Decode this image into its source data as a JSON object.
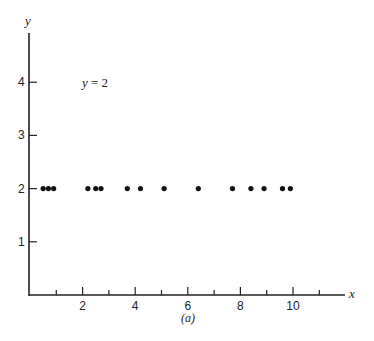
{
  "chart_data": {
    "type": "scatter",
    "title": "",
    "caption": "(a)",
    "xlabel": "x",
    "ylabel": "y",
    "xlim": [
      0,
      11.5
    ],
    "ylim": [
      0,
      4.9
    ],
    "grid": false,
    "legend": null,
    "annotation": {
      "text": "y = 2",
      "x": 2,
      "y": 4
    },
    "x_ticks_major": [
      2,
      4,
      6,
      8,
      10
    ],
    "x_ticks_minor": [
      1,
      3,
      5,
      7,
      9,
      11
    ],
    "x_tick_labels": [
      "2",
      "4",
      "6",
      "8",
      "10"
    ],
    "y_ticks": [
      1,
      2,
      3,
      4
    ],
    "y_tick_labels": [
      "1",
      "2",
      "3",
      "4"
    ],
    "series": [
      {
        "name": "y = 2",
        "x": [
          0.5,
          0.7,
          0.9,
          2.2,
          2.5,
          2.7,
          3.7,
          4.2,
          5.1,
          6.4,
          7.7,
          8.4,
          8.9,
          9.6,
          9.9
        ],
        "y": [
          2,
          2,
          2,
          2,
          2,
          2,
          2,
          2,
          2,
          2,
          2,
          2,
          2,
          2,
          2
        ]
      }
    ]
  },
  "labels": {
    "x_axis": "x",
    "y_axis": "y",
    "annotation_lhs": "y",
    "annotation_rhs": " = 2",
    "caption": "(a)"
  },
  "style": {
    "axis_color": "#222222",
    "dot_color": "#111111",
    "background": "#ffffff"
  }
}
